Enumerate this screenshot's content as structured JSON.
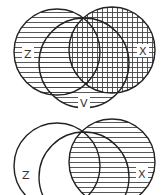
{
  "diagrams": [
    {
      "id": "top",
      "labels": {
        "z": "Z",
        "v": "V",
        "x": "X"
      },
      "shading": {
        "horizontal": "Z ∪ V ∪ X",
        "vertical": "X"
      }
    },
    {
      "id": "bottom",
      "labels": {
        "z": "Z",
        "x": "X"
      },
      "shading": {
        "horizontal": "X"
      }
    }
  ],
  "colors": {
    "stroke": "#222222",
    "hatch": "#333333",
    "background": "#ffffff"
  }
}
